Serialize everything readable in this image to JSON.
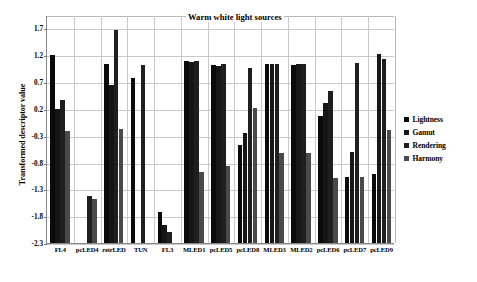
{
  "chart_data": {
    "type": "bar",
    "title": "Warm white light sources",
    "xlabel": "",
    "ylabel": "Transformed descriptor value",
    "ylim": [
      -2.3,
      1.95
    ],
    "yticks": [
      1.7,
      1.2,
      0.7,
      0.2,
      -0.3,
      -0.8,
      -1.3,
      -1.8,
      -2.3
    ],
    "ytick_labels": [
      "1.7",
      "1.2",
      "0.7",
      "0.2",
      "-0.3",
      "-0.8",
      "-1.3",
      "-1.8",
      "-2.3"
    ],
    "grid": true,
    "legend_position": "right",
    "categories": [
      "FL4",
      "pcLED4",
      "retrLED",
      "TUN",
      "FL3",
      "MLED1",
      "pcLED5",
      "pcLED8",
      "MLED3",
      "MLED2",
      "pcLED6",
      "pcLED7",
      "pcLED9"
    ],
    "series": [
      {
        "name": "Lightness",
        "color": "#0a0a0a",
        "values": [
          1.21,
          -2.3,
          1.03,
          0.77,
          -1.73,
          1.1,
          1.02,
          -0.48,
          1.03,
          1.02,
          0.07,
          -1.07,
          -1.02
        ]
      },
      {
        "name": "Gamut",
        "color": "#161616",
        "values": [
          0.19,
          -2.3,
          0.64,
          -2.3,
          -1.97,
          1.08,
          1.0,
          -0.25,
          1.04,
          1.03,
          0.31,
          -0.61,
          1.23
        ]
      },
      {
        "name": "Rendering",
        "color": "#1f1f1f",
        "values": [
          0.36,
          -1.43,
          1.68,
          1.02,
          -2.1,
          1.1,
          1.03,
          0.97,
          1.04,
          1.04,
          0.54,
          1.05,
          1.13
        ]
      },
      {
        "name": "Harmony",
        "color": "#4a4a4a",
        "values": [
          -0.21,
          -1.48,
          -0.17,
          -2.3,
          -2.3,
          -0.97,
          -0.87,
          0.21,
          -0.62,
          -0.62,
          -1.08,
          -1.07,
          -0.2
        ]
      }
    ]
  },
  "legend": {
    "items": [
      {
        "label": "Lightness"
      },
      {
        "label": "Gamut"
      },
      {
        "label": "Rendering"
      },
      {
        "label": "Harmony"
      }
    ]
  }
}
